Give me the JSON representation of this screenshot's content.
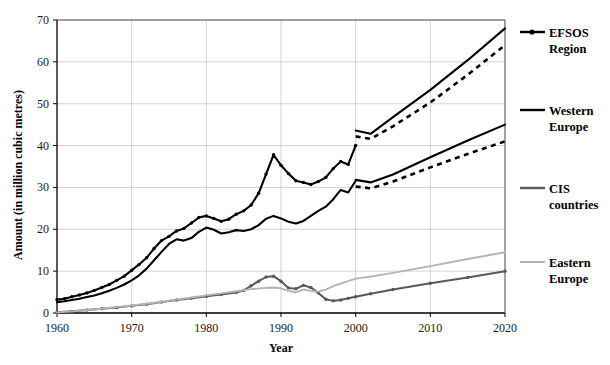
{
  "chart_data": {
    "type": "line",
    "title": "",
    "xlabel": "Year",
    "ylabel": "Amount (in million cubic metres)",
    "xlim": [
      1960,
      2020
    ],
    "ylim": [
      0,
      70
    ],
    "xticks": [
      1960,
      1970,
      1980,
      1990,
      2000,
      2010,
      2020
    ],
    "yticks": [
      0,
      10,
      20,
      30,
      40,
      50,
      60,
      70
    ],
    "grid": true,
    "legend_position": "right",
    "colors": {
      "efsos": "#000000",
      "western_europe": "#000000",
      "cis": "#595959",
      "eastern_europe": "#b3b3b3"
    },
    "series": [
      {
        "name": "EFSOS Region",
        "color": "#000000",
        "style": "solid-with-markers",
        "x": [
          1960,
          1961,
          1962,
          1963,
          1964,
          1965,
          1966,
          1967,
          1968,
          1969,
          1970,
          1971,
          1972,
          1973,
          1974,
          1975,
          1976,
          1977,
          1978,
          1979,
          1980,
          1981,
          1982,
          1983,
          1984,
          1985,
          1986,
          1987,
          1988,
          1989,
          1990,
          1991,
          1992,
          1993,
          1994,
          1995,
          1996,
          1997,
          1998,
          1999,
          2000
        ],
        "values": [
          3.2,
          3.4,
          3.9,
          4.3,
          4.8,
          5.4,
          6.1,
          6.8,
          7.8,
          8.8,
          10.2,
          11.6,
          13.2,
          15.4,
          17.3,
          18.3,
          19.6,
          20.2,
          21.5,
          22.8,
          23.2,
          22.6,
          21.9,
          22.4,
          23.6,
          24.4,
          25.8,
          28.6,
          33.2,
          37.8,
          35.3,
          33.3,
          31.6,
          31.2,
          30.7,
          31.4,
          32.4,
          34.5,
          36.2,
          35.5,
          40.0
        ]
      },
      {
        "name": "EFSOS Region high scenario",
        "color": "#000000",
        "style": "solid",
        "x": [
          2000,
          2002,
          2005,
          2010,
          2015,
          2020
        ],
        "values": [
          43.6,
          42.8,
          46.8,
          53.3,
          60.4,
          68.0
        ]
      },
      {
        "name": "EFSOS Region low scenario",
        "color": "#000000",
        "style": "dashed",
        "x": [
          2000,
          2002,
          2005,
          2010,
          2015,
          2020
        ],
        "values": [
          42.2,
          41.6,
          44.6,
          50.3,
          56.9,
          64.0
        ]
      },
      {
        "name": "Western Europe",
        "color": "#000000",
        "style": "solid",
        "x": [
          1960,
          1961,
          1962,
          1963,
          1964,
          1965,
          1966,
          1967,
          1968,
          1969,
          1970,
          1971,
          1972,
          1973,
          1974,
          1975,
          1976,
          1977,
          1978,
          1979,
          1980,
          1981,
          1982,
          1983,
          1984,
          1985,
          1986,
          1987,
          1988,
          1989,
          1990,
          1991,
          1992,
          1993,
          1994,
          1995,
          1996,
          1997,
          1998,
          1999,
          2000
        ],
        "values": [
          2.6,
          2.8,
          3.1,
          3.4,
          3.8,
          4.2,
          4.7,
          5.3,
          6.0,
          6.8,
          7.8,
          9.0,
          10.6,
          12.6,
          14.6,
          16.5,
          17.6,
          17.3,
          17.9,
          19.4,
          20.4,
          19.9,
          19.0,
          19.3,
          19.8,
          19.6,
          20.0,
          21.0,
          22.5,
          23.2,
          22.6,
          21.8,
          21.4,
          22.0,
          23.2,
          24.4,
          25.4,
          27.2,
          29.4,
          28.8,
          31.6
        ]
      },
      {
        "name": "Western Europe high scenario",
        "color": "#000000",
        "style": "solid",
        "x": [
          2000,
          2002,
          2005,
          2010,
          2015,
          2020
        ],
        "values": [
          31.8,
          31.2,
          33.1,
          37.2,
          41.2,
          45.0
        ]
      },
      {
        "name": "Western Europe low scenario",
        "color": "#000000",
        "style": "dashed",
        "x": [
          2000,
          2002,
          2005,
          2010,
          2015,
          2020
        ],
        "values": [
          30.2,
          29.8,
          31.4,
          34.8,
          38.0,
          41.0
        ]
      },
      {
        "name": "CIS countries",
        "color": "#595959",
        "style": "solid-with-markers",
        "x": [
          1960,
          1962,
          1964,
          1966,
          1968,
          1970,
          1972,
          1974,
          1976,
          1978,
          1980,
          1982,
          1984,
          1985,
          1986,
          1987,
          1988,
          1989,
          1990,
          1991,
          1992,
          1993,
          1994,
          1995,
          1996,
          1997,
          1998,
          1999,
          2000,
          2002,
          2005,
          2010,
          2015,
          2020
        ],
        "values": [
          0.2,
          0.4,
          0.7,
          1.0,
          1.3,
          1.7,
          2.1,
          2.6,
          3.1,
          3.5,
          4.0,
          4.4,
          4.9,
          5.4,
          6.5,
          7.6,
          8.6,
          8.8,
          7.6,
          6.0,
          5.8,
          6.6,
          6.1,
          4.8,
          3.3,
          2.9,
          3.1,
          3.5,
          3.9,
          4.6,
          5.6,
          7.1,
          8.5,
          10.0
        ]
      },
      {
        "name": "Eastern Europe",
        "color": "#b3b3b3",
        "style": "solid",
        "x": [
          1960,
          1962,
          1964,
          1966,
          1968,
          1970,
          1972,
          1974,
          1976,
          1978,
          1980,
          1982,
          1984,
          1986,
          1988,
          1989,
          1990,
          1991,
          1992,
          1993,
          1994,
          1995,
          1996,
          1997,
          1998,
          1999,
          2000,
          2002,
          2005,
          2010,
          2015,
          2020
        ],
        "values": [
          0.15,
          0.4,
          0.7,
          1.0,
          1.4,
          1.8,
          2.2,
          2.7,
          3.2,
          3.7,
          4.2,
          4.7,
          5.2,
          5.7,
          6.0,
          6.1,
          5.9,
          5.3,
          4.9,
          5.6,
          5.3,
          5.1,
          5.6,
          6.4,
          7.0,
          7.6,
          8.2,
          8.7,
          9.6,
          11.2,
          12.9,
          14.5
        ]
      }
    ]
  },
  "legend": {
    "items": [
      {
        "label_line1": "EFSOS",
        "label_line2": "Region",
        "style": "line-marker",
        "color": "#000000"
      },
      {
        "label_line1": "Western",
        "label_line2": "Europe",
        "style": "line",
        "color": "#000000"
      },
      {
        "label_line1": "CIS",
        "label_line2": "countries",
        "style": "line",
        "color": "#595959"
      },
      {
        "label_line1": "Eastern",
        "label_line2": "Europe",
        "style": "line",
        "color": "#b3b3b3"
      }
    ]
  }
}
